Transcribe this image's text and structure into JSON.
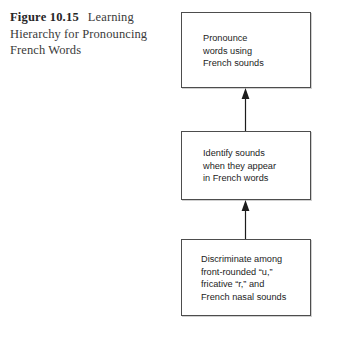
{
  "figure": {
    "label": "Figure 10.15",
    "caption": "Learning Hierarchy for Pronouncing French Words"
  },
  "diagram": {
    "type": "flowchart",
    "orientation": "bottom-to-top",
    "nodes": [
      {
        "id": "node-top",
        "level": 3,
        "text": "Pronounce\nwords using\nFrench sounds"
      },
      {
        "id": "node-middle",
        "level": 2,
        "text": "Identify sounds\nwhen they appear\nin French words"
      },
      {
        "id": "node-bottom",
        "level": 1,
        "text": "Discriminate among\nfront-rounded “u,”\nfricative “r,” and\nFrench nasal sounds"
      }
    ],
    "arrows": [
      {
        "id": "arrow-lower-to-middle",
        "from": "node-bottom",
        "to": "node-middle",
        "direction": "up"
      },
      {
        "id": "arrow-middle-to-top",
        "from": "node-middle",
        "to": "node-top",
        "direction": "up"
      }
    ],
    "colors": {
      "background": "#ffffff",
      "box_border": "#4d4d4d",
      "box_fill": "#ffffff",
      "box_text": "#1c1c1c",
      "arrow": "#1c1c1c",
      "caption_label": "#262626",
      "caption_text": "#3a3a3a"
    }
  }
}
